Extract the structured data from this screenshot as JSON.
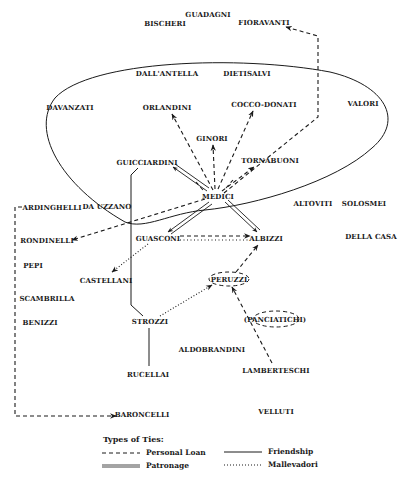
{
  "diagram": {
    "boundary_label": "",
    "nodes": [
      {
        "id": "bischeri",
        "label": "BISCHERI",
        "x": 165,
        "y": 23
      },
      {
        "id": "guadagni",
        "label": "GUADAGNI",
        "x": 208,
        "y": 14
      },
      {
        "id": "fioravanti",
        "label": "FIORAVANTI",
        "x": 264,
        "y": 22
      },
      {
        "id": "dallantella",
        "label": "DALL'ANTELLA",
        "x": 167,
        "y": 73
      },
      {
        "id": "dietisalvi",
        "label": "DIETISALVI",
        "x": 247,
        "y": 73
      },
      {
        "id": "davanzati",
        "label": "DAVANZATI",
        "x": 70,
        "y": 107
      },
      {
        "id": "orlandini",
        "label": "ORLANDINI",
        "x": 167,
        "y": 107
      },
      {
        "id": "cocco_donati",
        "label": "COCCO-DONATI",
        "x": 264,
        "y": 104
      },
      {
        "id": "valori",
        "label": "VALORI",
        "x": 363,
        "y": 103
      },
      {
        "id": "ginori",
        "label": "GINORI",
        "x": 212,
        "y": 138
      },
      {
        "id": "guicciardini",
        "label": "GUICCIARDINI",
        "x": 147,
        "y": 162
      },
      {
        "id": "tornabuoni",
        "label": "TORNABUONI",
        "x": 270,
        "y": 160
      },
      {
        "id": "medici",
        "label": "MEDICI",
        "x": 218,
        "y": 196
      },
      {
        "id": "ardinghelli",
        "label": "ARDINGHELLI",
        "x": 52,
        "y": 207
      },
      {
        "id": "da_uzzano",
        "label": "DA UZZANO",
        "x": 107,
        "y": 206
      },
      {
        "id": "altoviti",
        "label": "ALTOVITI",
        "x": 313,
        "y": 203
      },
      {
        "id": "solosmei",
        "label": "SOLOSMEI",
        "x": 364,
        "y": 203
      },
      {
        "id": "rondinelli",
        "label": "RONDINELLI",
        "x": 47,
        "y": 240
      },
      {
        "id": "guasconi",
        "label": "GUASCONI",
        "x": 158,
        "y": 238
      },
      {
        "id": "albizzi",
        "label": "ALBIZZI",
        "x": 266,
        "y": 238
      },
      {
        "id": "della_casa",
        "label": "DELLA CASA",
        "x": 371,
        "y": 236
      },
      {
        "id": "pepi",
        "label": "PEPI",
        "x": 33,
        "y": 265
      },
      {
        "id": "castellani",
        "label": "CASTELLANI",
        "x": 106,
        "y": 280
      },
      {
        "id": "peruzzi",
        "label": "PERUZZI",
        "x": 229,
        "y": 279
      },
      {
        "id": "scambrilla",
        "label": "SCAMBRILLA",
        "x": 47,
        "y": 298
      },
      {
        "id": "panciatichi",
        "label": "(PANCIATICHI)",
        "x": 275,
        "y": 319
      },
      {
        "id": "benizzi",
        "label": "BENIZZI",
        "x": 40,
        "y": 322
      },
      {
        "id": "strozzi",
        "label": "STROZZI",
        "x": 150,
        "y": 321
      },
      {
        "id": "aldobrandini",
        "label": "ALDOBRANDINI",
        "x": 212,
        "y": 349
      },
      {
        "id": "rucellai",
        "label": "RUCELLAI",
        "x": 148,
        "y": 374
      },
      {
        "id": "lamberteschi",
        "label": "LAMBERTESCHI",
        "x": 276,
        "y": 370
      },
      {
        "id": "baroncelli",
        "label": "BARONCELLI",
        "x": 142,
        "y": 414
      },
      {
        "id": "velluti",
        "label": "VELLUTI",
        "x": 276,
        "y": 411
      }
    ],
    "edges": [
      {
        "from": "medici",
        "to": "orlandini",
        "type": "personal_loan"
      },
      {
        "from": "medici",
        "to": "ginori",
        "type": "personal_loan"
      },
      {
        "from": "medici",
        "to": "cocco_donati",
        "type": "personal_loan"
      },
      {
        "from": "medici",
        "to": "tornabuoni",
        "type": "personal_loan"
      },
      {
        "from": "medici",
        "to": "fioravanti",
        "type": "personal_loan"
      },
      {
        "from": "medici",
        "to": "rondinelli",
        "type": "personal_loan"
      },
      {
        "from": "medici",
        "to": "guicciardini",
        "type": "patronage"
      },
      {
        "from": "medici",
        "to": "guasconi",
        "type": "patronage"
      },
      {
        "from": "medici",
        "to": "albizzi",
        "type": "patronage"
      },
      {
        "from": "guasconi",
        "to": "albizzi",
        "type": "personal_loan"
      },
      {
        "from": "guasconi",
        "to": "albizzi",
        "type": "mallevadori"
      },
      {
        "from": "guasconi",
        "to": "castellani",
        "type": "mallevadori"
      },
      {
        "from": "peruzzi",
        "to": "albizzi",
        "type": "personal_loan"
      },
      {
        "from": "strozzi",
        "to": "peruzzi",
        "type": "mallevadori"
      },
      {
        "from": "lamberteschi",
        "to": "peruzzi",
        "type": "personal_loan"
      },
      {
        "from": "guicciardini",
        "to": "strozzi",
        "type": "friendship"
      },
      {
        "from": "strozzi",
        "to": "rucellai",
        "type": "friendship"
      },
      {
        "from": "ardinghelli",
        "to": "baroncelli",
        "type": "personal_loan"
      }
    ]
  },
  "legend": {
    "title": "Types of Ties:",
    "items": [
      {
        "key": "personal_loan",
        "label": "Personal Loan",
        "sample": "- - - -"
      },
      {
        "key": "friendship",
        "label": "Friendship",
        "sample": "————"
      },
      {
        "key": "patronage",
        "label": "Patronage",
        "sample": "═════"
      },
      {
        "key": "mallevadori",
        "label": "Mallevadori",
        "sample": "++++++++"
      }
    ]
  },
  "colors": {
    "ink": "#1a1a1a",
    "background": "#ffffff"
  }
}
